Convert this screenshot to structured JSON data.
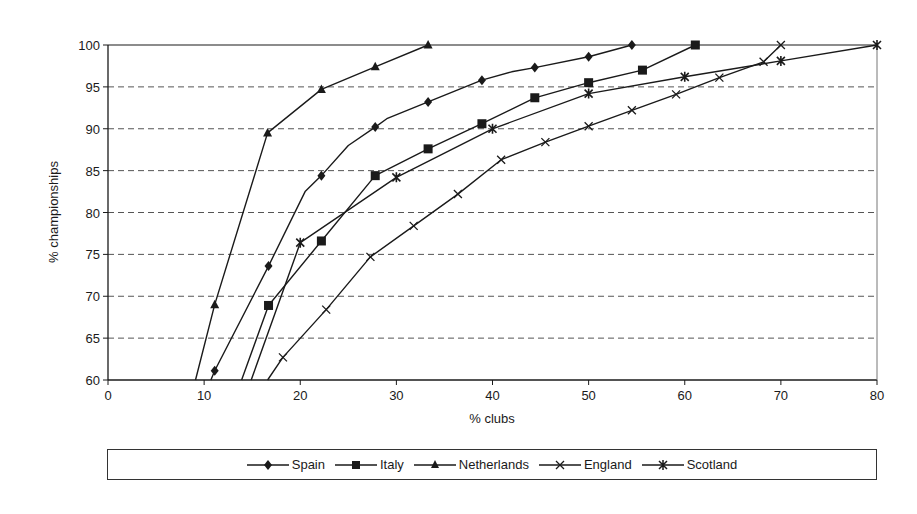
{
  "chart_data": {
    "type": "line",
    "title": "",
    "xlabel": "% clubs",
    "ylabel": "% championships",
    "xlim": [
      0,
      80
    ],
    "ylim": [
      60,
      100
    ],
    "x_ticks": [
      0,
      10,
      20,
      30,
      40,
      50,
      60,
      70,
      80
    ],
    "y_ticks": [
      60,
      65,
      70,
      75,
      80,
      85,
      90,
      95,
      100
    ],
    "grid": {
      "y": "dashed",
      "x": "none"
    },
    "legend_position": "bottom",
    "series": [
      {
        "name": "Spain",
        "marker": "diamond",
        "points": [
          [
            10.7,
            60
          ],
          [
            11.1,
            61.1
          ],
          [
            16.7,
            73.6
          ],
          [
            20.5,
            82.5
          ],
          [
            22.2,
            84.4
          ],
          [
            25,
            88
          ],
          [
            27.8,
            90.2
          ],
          [
            29,
            91.2
          ],
          [
            33.3,
            93.2
          ],
          [
            38.9,
            95.8
          ],
          [
            42,
            96.8
          ],
          [
            44.4,
            97.3
          ],
          [
            50,
            98.6
          ],
          [
            54.5,
            100
          ]
        ],
        "marked": [
          [
            11.1,
            61.1
          ],
          [
            16.7,
            73.6
          ],
          [
            22.2,
            84.4
          ],
          [
            27.8,
            90.2
          ],
          [
            33.3,
            93.2
          ],
          [
            38.9,
            95.8
          ],
          [
            44.4,
            97.3
          ],
          [
            50,
            98.6
          ],
          [
            54.5,
            100
          ]
        ]
      },
      {
        "name": "Italy",
        "marker": "square",
        "points": [
          [
            13.9,
            60
          ],
          [
            16.7,
            68.9
          ],
          [
            22.2,
            76.6
          ],
          [
            27.8,
            84.4
          ],
          [
            33.3,
            87.6
          ],
          [
            38.9,
            90.6
          ],
          [
            44.4,
            93.7
          ],
          [
            50,
            95.5
          ],
          [
            55.6,
            97
          ],
          [
            61.1,
            100
          ]
        ],
        "marked": [
          [
            16.7,
            68.9
          ],
          [
            22.2,
            76.6
          ],
          [
            27.8,
            84.4
          ],
          [
            33.3,
            87.6
          ],
          [
            38.9,
            90.6
          ],
          [
            44.4,
            93.7
          ],
          [
            50,
            95.5
          ],
          [
            55.6,
            97
          ],
          [
            61.1,
            100
          ]
        ]
      },
      {
        "name": "Netherlands",
        "marker": "triangle",
        "points": [
          [
            9.1,
            60
          ],
          [
            11.1,
            69
          ],
          [
            16.6,
            89.5
          ],
          [
            22.2,
            94.7
          ],
          [
            27.8,
            97.4
          ],
          [
            33.3,
            100
          ]
        ],
        "marked": [
          [
            11.1,
            69
          ],
          [
            16.6,
            89.5
          ],
          [
            22.2,
            94.7
          ],
          [
            27.8,
            97.4
          ],
          [
            33.3,
            100
          ]
        ]
      },
      {
        "name": "England",
        "marker": "x",
        "points": [
          [
            16.6,
            60
          ],
          [
            18.2,
            62.7
          ],
          [
            22.7,
            68.4
          ],
          [
            27.3,
            74.7
          ],
          [
            31.8,
            78.4
          ],
          [
            36.4,
            82.2
          ],
          [
            40.9,
            86.3
          ],
          [
            45.5,
            88.4
          ],
          [
            50,
            90.3
          ],
          [
            54.5,
            92.2
          ],
          [
            59.1,
            94.1
          ],
          [
            63.6,
            96.1
          ],
          [
            68.2,
            98
          ],
          [
            70,
            100
          ]
        ],
        "marked": [
          [
            18.2,
            62.7
          ],
          [
            22.7,
            68.4
          ],
          [
            27.3,
            74.7
          ],
          [
            31.8,
            78.4
          ],
          [
            36.4,
            82.2
          ],
          [
            40.9,
            86.3
          ],
          [
            45.5,
            88.4
          ],
          [
            50,
            90.3
          ],
          [
            54.5,
            92.2
          ],
          [
            59.1,
            94.1
          ],
          [
            63.6,
            96.1
          ],
          [
            68.2,
            98
          ],
          [
            70,
            100
          ]
        ]
      },
      {
        "name": "Scotland",
        "marker": "asterisk",
        "points": [
          [
            14.9,
            60
          ],
          [
            20,
            76.4
          ],
          [
            30,
            84.2
          ],
          [
            40,
            90
          ],
          [
            50,
            94.2
          ],
          [
            60,
            96.2
          ],
          [
            70,
            98.1
          ],
          [
            80,
            100
          ]
        ],
        "marked": [
          [
            20,
            76.4
          ],
          [
            30,
            84.2
          ],
          [
            40,
            90
          ],
          [
            50,
            94.2
          ],
          [
            60,
            96.2
          ],
          [
            70,
            98.1
          ],
          [
            80,
            100
          ]
        ]
      }
    ]
  },
  "colors": {
    "line": "#1a1a1a",
    "grid": "#555555",
    "background": "#ffffff"
  },
  "legend": {
    "items": [
      {
        "label": "Spain",
        "icon": "diamond-marker-icon"
      },
      {
        "label": "Italy",
        "icon": "square-marker-icon"
      },
      {
        "label": "Netherlands",
        "icon": "triangle-marker-icon"
      },
      {
        "label": "England",
        "icon": "x-marker-icon"
      },
      {
        "label": "Scotland",
        "icon": "asterisk-marker-icon"
      }
    ]
  }
}
